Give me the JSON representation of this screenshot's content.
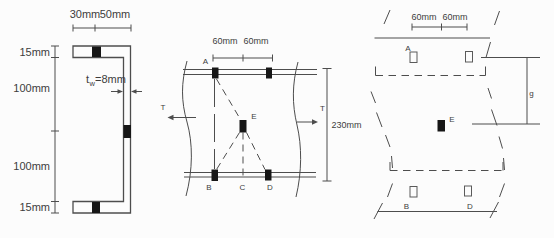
{
  "palette": {
    "line_color": "#4d4d4d",
    "text_color": "#3d3d3d",
    "bolt_color": "#161616",
    "background": "#fcfcfc"
  },
  "left_view": {
    "top_dims": [
      "30mm",
      "50mm"
    ],
    "side_dims": [
      "15mm",
      "100mm",
      "100mm",
      "15mm"
    ],
    "web_thickness": {
      "prefix": "t",
      "sub": "w",
      "value": "=8mm"
    }
  },
  "middle_view": {
    "top_dims": [
      "60mm",
      "60mm"
    ],
    "height_dim": "230mm",
    "force_left": "T",
    "force_right": "T",
    "bolt_labels": {
      "a": "A",
      "b": "B",
      "c": "C",
      "d": "D",
      "e": "E"
    }
  },
  "right_view": {
    "top_dims": [
      "60mm",
      "60mm"
    ],
    "gauge_label": "g",
    "bolt_labels": {
      "a": "A",
      "b": "B",
      "d": "D",
      "e": "E"
    }
  }
}
